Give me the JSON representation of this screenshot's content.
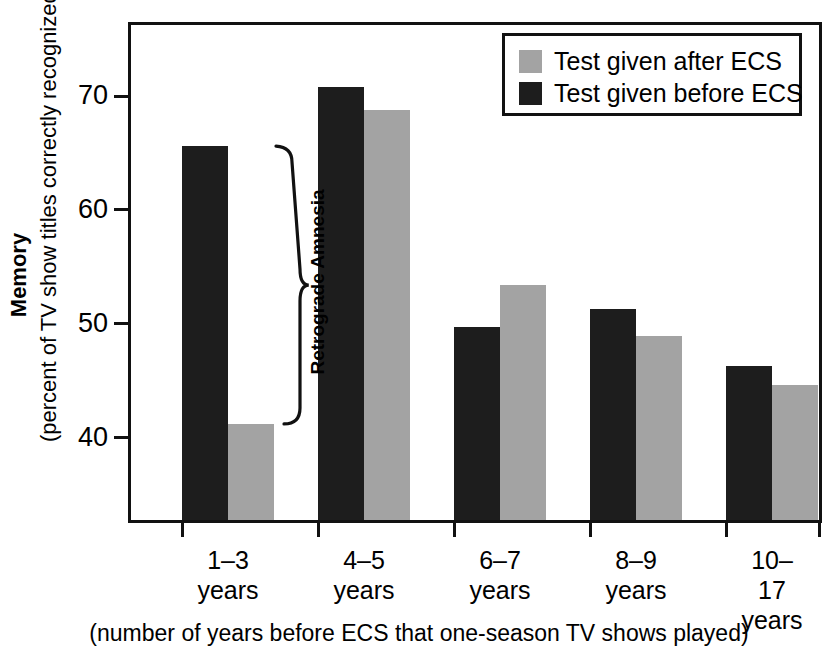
{
  "page": {
    "clipped_top_text": "(print edge — partially cropped line of text)"
  },
  "chart_data": {
    "type": "bar",
    "title": "",
    "subtitle": "",
    "xlabel": "(number of years before ECS that one-season TV shows played)",
    "ylabel": "Memory",
    "ylabel_sub": "(percent of TV show titles correctly recognized)",
    "categories": [
      "1–3\nyears",
      "4–5\nyears",
      "6–7\nyears",
      "8–9\nyears",
      "10–17\nyears"
    ],
    "category_labels_flat": [
      "1–3 years",
      "4–5 years",
      "6–7 years",
      "8–9 years",
      "10–17 years"
    ],
    "series": [
      {
        "name": "Test given before ECS",
        "color": "#1d1d1d",
        "values": [
          65.6,
          70.8,
          49.7,
          51.3,
          46.3
        ]
      },
      {
        "name": "Test given after ECS",
        "color": "#a3a3a3",
        "values": [
          41.2,
          68.8,
          53.4,
          48.9,
          44.6
        ]
      }
    ],
    "yticks": [
      40,
      50,
      60,
      70
    ],
    "ytick_labels": [
      "40",
      "50",
      "60",
      "70"
    ],
    "ylim": [
      32.5,
      76.5
    ],
    "grid": false,
    "legend_position": "top-right",
    "annotations": [
      {
        "text": "Retrograde Amnesia",
        "type": "brace",
        "group": "1–3 years",
        "from_value": 65.6,
        "to_value": 41.2
      }
    ]
  },
  "legend": {
    "items": [
      {
        "label": "Test given after ECS",
        "color": "#a3a3a3"
      },
      {
        "label": "Test given before ECS",
        "color": "#1d1d1d"
      }
    ]
  },
  "axis": {
    "y_title_main": "Memory",
    "y_title_sub": "(percent of TV show titles correctly recognized)",
    "x_caption": "(number of years before ECS that one-season TV shows played)"
  }
}
